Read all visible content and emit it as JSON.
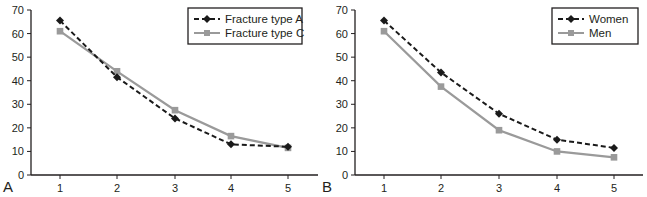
{
  "chart_data": [
    {
      "type": "line",
      "panel_label": "A",
      "title": "",
      "xlabel": "",
      "ylabel": "",
      "categories": [
        "1",
        "2",
        "3",
        "4",
        "5"
      ],
      "x": [
        1,
        2,
        3,
        4,
        5
      ],
      "ylim": [
        0,
        70
      ],
      "yticks": [
        0,
        10,
        20,
        30,
        40,
        50,
        60,
        70
      ],
      "grid": false,
      "legend_position": "upper right",
      "series": [
        {
          "name": "Fracture type A",
          "style": "dashed",
          "marker": "diamond",
          "color": "#1a1a1a",
          "values": [
            65.5,
            41.5,
            24,
            13,
            12
          ]
        },
        {
          "name": "Fracture type C",
          "style": "solid",
          "marker": "square",
          "color": "#9a9a9a",
          "values": [
            61,
            44,
            27.5,
            16.5,
            11.5
          ]
        }
      ]
    },
    {
      "type": "line",
      "panel_label": "B",
      "title": "",
      "xlabel": "",
      "ylabel": "",
      "categories": [
        "1",
        "2",
        "3",
        "4",
        "5"
      ],
      "x": [
        1,
        2,
        3,
        4,
        5
      ],
      "ylim": [
        0,
        70
      ],
      "yticks": [
        0,
        10,
        20,
        30,
        40,
        50,
        60,
        70
      ],
      "grid": false,
      "legend_position": "upper right",
      "series": [
        {
          "name": "Women",
          "style": "dashed",
          "marker": "diamond",
          "color": "#1a1a1a",
          "values": [
            65.5,
            43.5,
            26,
            15,
            11.5
          ]
        },
        {
          "name": "Men",
          "style": "solid",
          "marker": "square",
          "color": "#9a9a9a",
          "values": [
            61,
            37.5,
            19,
            10,
            7.5
          ]
        }
      ]
    }
  ]
}
